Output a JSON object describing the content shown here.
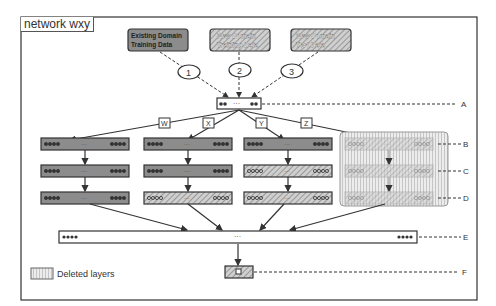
{
  "title": "network wxy",
  "sources": [
    {
      "label_line1": "Existing Domain",
      "label_line2": "Training Data",
      "style": "solid"
    },
    {
      "label_line1": "New Domain",
      "label_line2": "Training Data",
      "style": "hatched"
    },
    {
      "label_line1": "New Domain",
      "label_line2": "Test Data",
      "style": "hatched"
    }
  ],
  "steps": [
    "1",
    "2",
    "3"
  ],
  "branches": [
    "W",
    "X",
    "Y",
    "Z"
  ],
  "layer_labels": [
    "A",
    "B",
    "C",
    "D",
    "E",
    "F"
  ],
  "node_ellipsis": "···",
  "legend": {
    "label": "Deleted layers"
  },
  "colors": {
    "solid": "#8c8c8c",
    "hatch_dark": "#9a9a9a",
    "hatch_light": "#c8c8c8",
    "deleted": "#d9d9d9",
    "line": "#333333"
  }
}
